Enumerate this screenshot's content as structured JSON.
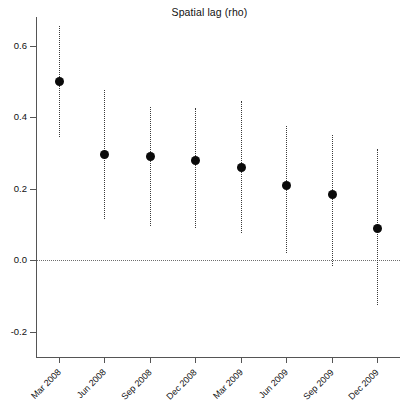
{
  "chart_data": {
    "type": "scatter",
    "title": "Spatial lag (rho)",
    "xlabel": "",
    "ylabel": "",
    "categories": [
      "Mar 2008",
      "Jun 2008",
      "Sep 2008",
      "Dec 2008",
      "Mar 2009",
      "Jun 2009",
      "Sep 2009",
      "Dec 2009"
    ],
    "values": [
      0.5,
      0.295,
      0.29,
      0.28,
      0.26,
      0.21,
      0.185,
      0.09
    ],
    "ci_lower": [
      0.345,
      0.115,
      0.095,
      0.09,
      0.075,
      0.02,
      -0.015,
      -0.125
    ],
    "ci_upper": [
      0.655,
      0.475,
      0.43,
      0.425,
      0.445,
      0.375,
      0.35,
      0.31
    ],
    "ylim": [
      -0.27,
      0.68
    ],
    "yticks": [
      -0.2,
      0.0,
      0.2,
      0.4,
      0.6
    ],
    "ytick_labels": [
      "-0.2",
      "0.0",
      "0.2",
      "0.4",
      "0.6"
    ],
    "grid": false,
    "legend": null,
    "zero_reference_line": 0.0,
    "error_bar_style": "dotted-vertical",
    "marker_style": "filled-circle",
    "marker_color": "#0a0a0a",
    "line_color": "#3a3a3a",
    "axis_color": "#555555",
    "background_color": "#ffffff"
  }
}
